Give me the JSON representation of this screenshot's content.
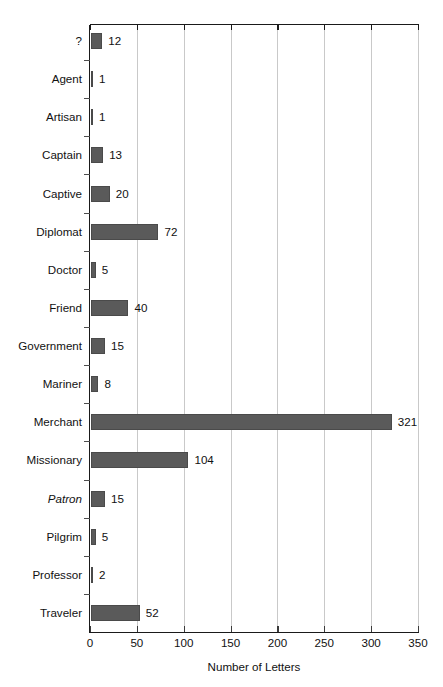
{
  "chart_data": {
    "type": "bar",
    "orientation": "horizontal",
    "title": "",
    "xlabel": "Number of Letters",
    "ylabel": "",
    "xlim": [
      0,
      350
    ],
    "xticks": [
      0,
      50,
      100,
      150,
      200,
      250,
      300,
      350
    ],
    "xtick_labels": [
      "0",
      "50",
      "100",
      "150",
      "200",
      "250",
      "300",
      "350"
    ],
    "grid": "vertical",
    "legend": "none",
    "bar_color": "#5a5a5a",
    "gridline_color": "#c9c9c9",
    "axis_color": "#1a1a1a",
    "categories": [
      "?",
      "Agent",
      "Artisan",
      "Captain",
      "Captive",
      "Diplomat",
      "Doctor",
      "Friend",
      "Government",
      "Mariner",
      "Merchant",
      "Missionary",
      "Patron",
      "Pilgrim",
      "Professor",
      "Traveler"
    ],
    "values": [
      12,
      1,
      1,
      13,
      20,
      72,
      5,
      40,
      15,
      8,
      321,
      104,
      15,
      5,
      2,
      52
    ],
    "data_labels": [
      "12",
      "1",
      "1",
      "13",
      "20",
      "72",
      "5",
      "40",
      "15",
      "8",
      "321",
      "104",
      "15",
      "5",
      "2",
      "52"
    ],
    "category_styles": [
      "normal",
      "normal",
      "normal",
      "normal",
      "normal",
      "normal",
      "normal",
      "normal",
      "normal",
      "normal",
      "normal",
      "normal",
      "italic",
      "normal",
      "normal",
      "normal"
    ],
    "rows": [
      {
        "label": "?",
        "value": 12,
        "data_label": "12",
        "style": "normal"
      },
      {
        "label": "Agent",
        "value": 1,
        "data_label": "1",
        "style": "normal"
      },
      {
        "label": "Artisan",
        "value": 1,
        "data_label": "1",
        "style": "normal"
      },
      {
        "label": "Captain",
        "value": 13,
        "data_label": "13",
        "style": "normal"
      },
      {
        "label": "Captive",
        "value": 20,
        "data_label": "20",
        "style": "normal"
      },
      {
        "label": "Diplomat",
        "value": 72,
        "data_label": "72",
        "style": "normal"
      },
      {
        "label": "Doctor",
        "value": 5,
        "data_label": "5",
        "style": "normal"
      },
      {
        "label": "Friend",
        "value": 40,
        "data_label": "40",
        "style": "normal"
      },
      {
        "label": "Government",
        "value": 15,
        "data_label": "15",
        "style": "normal"
      },
      {
        "label": "Mariner",
        "value": 8,
        "data_label": "8",
        "style": "normal"
      },
      {
        "label": "Merchant",
        "value": 321,
        "data_label": "321",
        "style": "normal"
      },
      {
        "label": "Missionary",
        "value": 104,
        "data_label": "104",
        "style": "normal"
      },
      {
        "label": "Patron",
        "value": 15,
        "data_label": "15",
        "style": "italic"
      },
      {
        "label": "Pilgrim",
        "value": 5,
        "data_label": "5",
        "style": "normal"
      },
      {
        "label": "Professor",
        "value": 2,
        "data_label": "2",
        "style": "normal"
      },
      {
        "label": "Traveler",
        "value": 52,
        "data_label": "52",
        "style": "normal"
      }
    ]
  }
}
